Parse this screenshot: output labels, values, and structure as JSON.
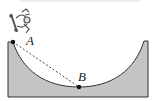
{
  "figure": {
    "type": "half-pipe diagram",
    "points": [
      {
        "name": "A",
        "x": 13,
        "y": 42,
        "label_x": 26,
        "label_y": 45
      },
      {
        "name": "B",
        "x": 79,
        "y": 87,
        "label_x": 78,
        "label_y": 81
      }
    ],
    "labels": {
      "point_a": "A",
      "point_b": "B"
    },
    "colors": {
      "ramp_fill": "#c4c4c4",
      "outline": "#333333",
      "dashed_line": "#444444",
      "point": "#111111",
      "skater": "#555555"
    },
    "icons": {
      "skater": "skateboarder-figure"
    }
  }
}
